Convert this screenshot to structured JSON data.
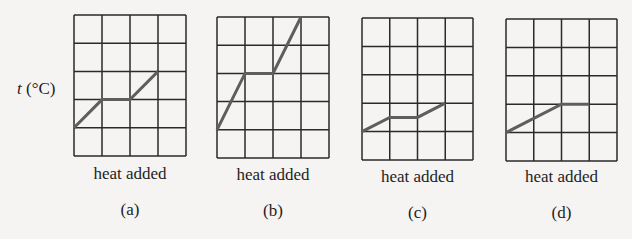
{
  "figure": {
    "y_axis_label_var": "t",
    "y_axis_label_unit": " (°C)",
    "x_axis_label": "heat added",
    "colors": {
      "background": "#f5f4f2",
      "grid": "#2a2a2a",
      "curve": "#5e5e5e",
      "text": "#1e1e1e"
    },
    "grid": {
      "cols": 4,
      "rows": 5
    }
  },
  "panels": [
    {
      "label": "(a)",
      "xlabel": "heat added",
      "box": {
        "x": 74,
        "y": 15,
        "w": 112,
        "h": 141
      },
      "points": [
        [
          0,
          1
        ],
        [
          1,
          2
        ],
        [
          2,
          2
        ],
        [
          3,
          3
        ]
      ]
    },
    {
      "label": "(b)",
      "xlabel": "heat added",
      "box": {
        "x": 217,
        "y": 17,
        "w": 112,
        "h": 141
      },
      "points": [
        [
          0,
          1
        ],
        [
          1,
          3
        ],
        [
          2,
          3
        ],
        [
          3,
          5
        ]
      ]
    },
    {
      "label": "(c)",
      "xlabel": "heat added",
      "box": {
        "x": 362,
        "y": 18,
        "w": 111,
        "h": 142
      },
      "points": [
        [
          0,
          1
        ],
        [
          1,
          1.5
        ],
        [
          2,
          1.5
        ],
        [
          3,
          2
        ]
      ]
    },
    {
      "label": "(d)",
      "xlabel": "heat added",
      "box": {
        "x": 506,
        "y": 19,
        "w": 111,
        "h": 142
      },
      "points": [
        [
          0,
          1
        ],
        [
          2,
          2
        ],
        [
          3,
          2
        ]
      ]
    }
  ],
  "chart_data": [
    {
      "type": "line",
      "title": "(a)",
      "xlabel": "heat added",
      "ylabel": "t (°C)",
      "x": [
        0,
        1,
        2,
        3
      ],
      "values": [
        1,
        2,
        2,
        3
      ],
      "xlim": [
        0,
        4
      ],
      "ylim": [
        0,
        5
      ],
      "grid": true
    },
    {
      "type": "line",
      "title": "(b)",
      "xlabel": "heat added",
      "ylabel": "t (°C)",
      "x": [
        0,
        1,
        2,
        3
      ],
      "values": [
        1,
        3,
        3,
        5
      ],
      "xlim": [
        0,
        4
      ],
      "ylim": [
        0,
        5
      ],
      "grid": true
    },
    {
      "type": "line",
      "title": "(c)",
      "xlabel": "heat added",
      "ylabel": "t (°C)",
      "x": [
        0,
        1,
        2,
        3
      ],
      "values": [
        1,
        1.5,
        1.5,
        2
      ],
      "xlim": [
        0,
        4
      ],
      "ylim": [
        0,
        5
      ],
      "grid": true
    },
    {
      "type": "line",
      "title": "(d)",
      "xlabel": "heat added",
      "ylabel": "t (°C)",
      "x": [
        0,
        2,
        3
      ],
      "values": [
        1,
        2,
        2
      ],
      "xlim": [
        0,
        4
      ],
      "ylim": [
        0,
        5
      ],
      "grid": true
    }
  ]
}
